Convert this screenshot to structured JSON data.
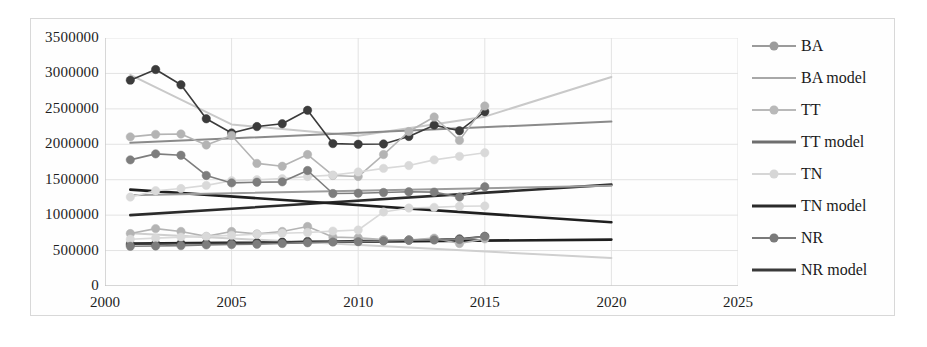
{
  "chart_data": {
    "type": "line",
    "title": "",
    "xlabel": "",
    "ylabel": "",
    "xlim": [
      2000,
      2025
    ],
    "ylim": [
      0,
      3500000
    ],
    "x_ticks": [
      2000,
      2005,
      2010,
      2015,
      2020,
      2025
    ],
    "y_ticks": [
      0,
      500000,
      1000000,
      1500000,
      2000000,
      2500000,
      3000000,
      3500000
    ],
    "y_tick_labels": [
      "0",
      "500000",
      "1000000",
      "1500000",
      "2000000",
      "2500000",
      "3000000",
      "3500000"
    ],
    "x_tick_labels": [
      "2000",
      "2005",
      "2010",
      "2015",
      "2020",
      "2025"
    ],
    "grid": true,
    "legend_position": "right",
    "observed_x": [
      2001,
      2002,
      2003,
      2004,
      2005,
      2006,
      2007,
      2008,
      2009,
      2010,
      2011,
      2012,
      2013,
      2014,
      2015
    ],
    "series": [
      {
        "name": "BA",
        "kind": "markers",
        "color": "#3b3b3b",
        "values": [
          2905000,
          3055000,
          2840000,
          2360000,
          2160000,
          2250000,
          2290000,
          2480000,
          2010000,
          2000000,
          2005000,
          2110000,
          2270000,
          2190000,
          2460000
        ]
      },
      {
        "name": "BA model",
        "kind": "trend",
        "color": "#c9c9c9",
        "x": [
          2001,
          2005,
          2010,
          2015,
          2020
        ],
        "values": [
          2980000,
          2280000,
          2120000,
          2390000,
          2950000
        ]
      },
      {
        "name": "TT",
        "kind": "markers",
        "color": "#b4b4b4",
        "values": [
          2105000,
          2140000,
          2145000,
          1990000,
          2125000,
          1730000,
          1690000,
          1855000,
          1560000,
          1545000,
          1855000,
          2180000,
          2385000,
          2055000,
          2540000
        ]
      },
      {
        "name": "TT model",
        "kind": "trend",
        "color": "#8a8a8a",
        "x": [
          2001,
          2020
        ],
        "values": [
          2020000,
          2320000
        ]
      },
      {
        "name": "TN",
        "kind": "markers",
        "color": "#d9d9d9",
        "values": [
          1255000,
          1345000,
          1375000,
          1420000,
          1485000,
          1500000,
          1515000,
          1545000,
          1565000,
          1610000,
          1660000,
          1700000,
          1780000,
          1830000,
          1880000
        ]
      },
      {
        "name": "TN model",
        "kind": "trend",
        "color": "#2b2b2b",
        "x": [
          2001,
          2020
        ],
        "values": [
          1000000,
          1430000
        ]
      },
      {
        "name": "NR",
        "kind": "markers",
        "color": "#7d7d7d",
        "values": [
          1780000,
          1865000,
          1845000,
          1560000,
          1455000,
          1465000,
          1470000,
          1630000,
          1305000,
          1310000,
          1320000,
          1330000,
          1325000,
          1255000,
          1400000
        ]
      },
      {
        "name": "NR model",
        "kind": "trend",
        "color": "#1f1f1f",
        "x": [
          2001,
          2020
        ],
        "values": [
          1360000,
          900000
        ]
      },
      {
        "name": "BA low",
        "kind": "markers",
        "color": "#3b3b3b",
        "values": [
          590000,
          595000,
          600000,
          600000,
          605000,
          610000,
          620000,
          630000,
          630000,
          640000,
          645000,
          650000,
          660000,
          665000,
          700000
        ]
      },
      {
        "name": "TT low",
        "kind": "markers",
        "color": "#b4b4b4",
        "values": [
          740000,
          810000,
          770000,
          700000,
          770000,
          735000,
          770000,
          840000,
          690000,
          680000,
          655000,
          650000,
          675000,
          600000,
          665000
        ]
      },
      {
        "name": "TN low",
        "kind": "markers",
        "color": "#d9d9d9",
        "values": [
          660000,
          675000,
          690000,
          700000,
          715000,
          730000,
          745000,
          755000,
          775000,
          790000,
          1045000,
          1100000,
          1110000,
          1125000,
          1130000
        ]
      },
      {
        "name": "NR low",
        "kind": "markers",
        "color": "#7d7d7d",
        "values": [
          560000,
          565000,
          570000,
          580000,
          585000,
          590000,
          600000,
          610000,
          620000,
          625000,
          635000,
          645000,
          650000,
          655000,
          700000
        ]
      },
      {
        "name": "TN low model",
        "kind": "trend",
        "color": "#1f1f1f",
        "x": [
          2001,
          2020
        ],
        "values": [
          600000,
          655000
        ]
      },
      {
        "name": "TT low model",
        "kind": "trend",
        "color": "#cfcfcf",
        "x": [
          2001,
          2020
        ],
        "values": [
          745000,
          395000
        ]
      },
      {
        "name": "TN mid model",
        "kind": "trend",
        "color": "#9c9c9c",
        "x": [
          2001,
          2020
        ],
        "values": [
          1280000,
          1415000
        ]
      }
    ]
  },
  "legend": {
    "items": [
      {
        "label": "BA",
        "marker": true,
        "color": "#9b9b9b",
        "thick": false
      },
      {
        "label": "BA model",
        "marker": false,
        "color": "#a8a8a8",
        "thick": false
      },
      {
        "label": "TT",
        "marker": true,
        "color": "#b9b9b9",
        "thick": false
      },
      {
        "label": "TT model",
        "marker": false,
        "color": "#6e6e6e",
        "thick": true
      },
      {
        "label": "TN",
        "marker": true,
        "color": "#d6d6d6",
        "thick": false
      },
      {
        "label": "TN model",
        "marker": false,
        "color": "#2a2a2a",
        "thick": true
      },
      {
        "label": "NR",
        "marker": true,
        "color": "#7a7a7a",
        "thick": false
      },
      {
        "label": "NR model",
        "marker": false,
        "color": "#3a3a3a",
        "thick": true
      }
    ]
  },
  "axes": {
    "grid_color": "#e3e3e3",
    "axis_color": "#bdbdbd",
    "frame_color": "#d8d8d8"
  }
}
